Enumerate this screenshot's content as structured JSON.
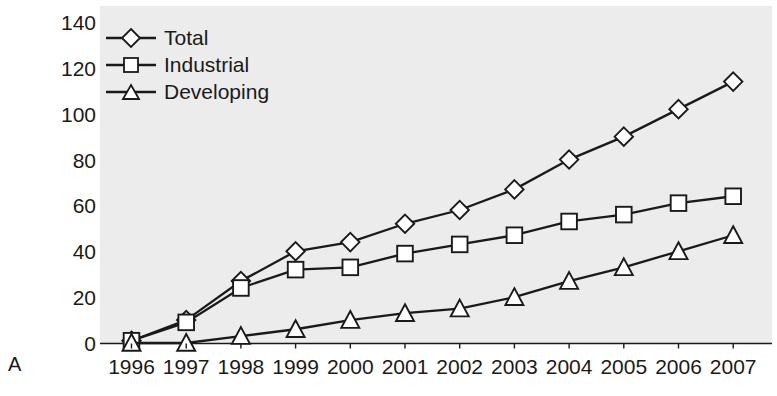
{
  "panel": {
    "label": "A"
  },
  "chart_data": {
    "type": "line",
    "title": "",
    "xlabel": "",
    "ylabel": "",
    "categories": [
      "1996",
      "1997",
      "1998",
      "1999",
      "2000",
      "2001",
      "2002",
      "2003",
      "2004",
      "2005",
      "2006",
      "2007"
    ],
    "x": [
      1996,
      1997,
      1998,
      1999,
      2000,
      2001,
      2002,
      2003,
      2004,
      2005,
      2006,
      2007
    ],
    "series": [
      {
        "name": "Total",
        "marker": "diamond",
        "values": [
          1,
          10,
          27,
          40,
          44,
          52,
          58,
          67,
          80,
          90,
          102,
          114
        ]
      },
      {
        "name": "Industrial",
        "marker": "square",
        "values": [
          1,
          9,
          24,
          32,
          33,
          39,
          43,
          47,
          53,
          56,
          61,
          64
        ]
      },
      {
        "name": "Developing",
        "marker": "triangle",
        "values": [
          0,
          0,
          3,
          6,
          10,
          13,
          15,
          20,
          27,
          33,
          40,
          47
        ]
      }
    ],
    "ylim": [
      0,
      140
    ],
    "yticks": [
      0,
      20,
      40,
      60,
      80,
      100,
      120,
      140
    ],
    "ytick_labels": [
      "0",
      "20",
      "40",
      "60",
      "80",
      "100",
      "120",
      "140"
    ],
    "grid": false,
    "legend_position": "top-left",
    "line_color": "#1a1a1a",
    "marker_fill": "#ffffff",
    "plot_background": "#ececed"
  }
}
